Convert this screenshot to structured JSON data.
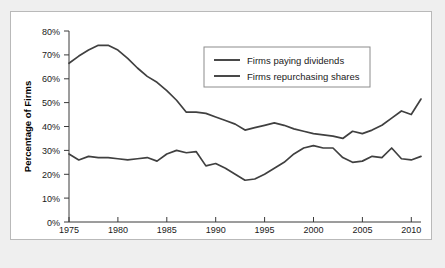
{
  "figure": {
    "background_color": "#efefef",
    "panel_color": "#ffffff",
    "border_color": "#b9b9b9",
    "line_color": "#404040"
  },
  "chart_data": {
    "type": "line",
    "title": "",
    "xlabel": "Year",
    "ylabel": "Percentage of Firms",
    "xlim": [
      1975,
      2011
    ],
    "ylim": [
      0,
      80
    ],
    "grid": false,
    "legend_position": "top-center",
    "xticks": [
      1975,
      1980,
      1985,
      1990,
      1995,
      2000,
      2005,
      2010
    ],
    "xtick_labels": [
      "1975",
      "1980",
      "1985",
      "1990",
      "1995",
      "2000",
      "2005",
      "2010"
    ],
    "yticks": [
      0,
      10,
      20,
      30,
      40,
      50,
      60,
      70,
      80
    ],
    "ytick_labels": [
      "0%",
      "10%",
      "20%",
      "30%",
      "40%",
      "50%",
      "60%",
      "70%",
      "80%"
    ],
    "x": [
      1975,
      1976,
      1977,
      1978,
      1979,
      1980,
      1981,
      1982,
      1983,
      1984,
      1985,
      1986,
      1987,
      1988,
      1989,
      1990,
      1991,
      1992,
      1993,
      1994,
      1995,
      1996,
      1997,
      1998,
      1999,
      2000,
      2001,
      2002,
      2003,
      2004,
      2005,
      2006,
      2007,
      2008,
      2009,
      2010,
      2011
    ],
    "series": [
      {
        "name": "Firms paying dividends",
        "values": [
          66.5,
          69.5,
          72.0,
          74.0,
          74.0,
          72.0,
          68.5,
          64.5,
          61.0,
          58.5,
          55.0,
          51.0,
          46.0,
          46.0,
          45.5,
          44.0,
          42.5,
          41.0,
          38.5,
          39.5,
          40.5,
          41.5,
          40.5,
          39.0,
          38.0,
          37.0,
          36.5,
          36.0,
          35.0,
          38.0,
          37.0,
          38.5,
          40.5,
          43.5,
          46.5,
          45.0,
          51.5
        ]
      },
      {
        "name": "Firms repurchasing shares",
        "values": [
          28.5,
          26.0,
          27.5,
          27.0,
          27.0,
          26.5,
          26.0,
          26.5,
          27.0,
          25.5,
          28.5,
          30.0,
          29.0,
          29.5,
          23.5,
          24.5,
          22.5,
          20.0,
          17.5,
          18.0,
          20.0,
          22.5,
          25.0,
          28.5,
          31.0,
          32.0,
          31.0,
          31.0,
          27.0,
          25.0,
          25.5,
          27.5,
          27.0,
          31.0,
          26.5,
          26.0,
          27.5
        ]
      }
    ]
  },
  "legend": {
    "entries": [
      {
        "label": "Firms paying dividends"
      },
      {
        "label": "Firms repurchasing shares"
      }
    ]
  }
}
